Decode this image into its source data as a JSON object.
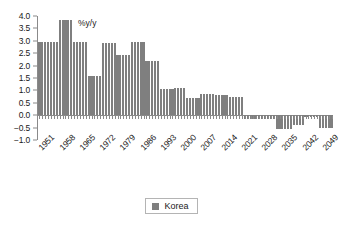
{
  "chart_data": {
    "type": "bar",
    "title": "",
    "subtitle": "",
    "annotation": "%y/y",
    "xlabel": "",
    "ylabel": "",
    "ylim": [
      -1.0,
      4.0
    ],
    "grid": false,
    "legend_position": "bottom",
    "y_ticks": [
      "4.0",
      "3.5",
      "3.0",
      "2.5",
      "2.0",
      "1.5",
      "1.0",
      "0.5",
      "0.0",
      "-0.5",
      "-1.0"
    ],
    "y_tick_values": [
      4.0,
      3.5,
      3.0,
      2.5,
      2.0,
      1.5,
      1.0,
      0.5,
      0.0,
      -0.5,
      -1.0
    ],
    "x_tick_labels": [
      "1951",
      "1958",
      "1965",
      "1972",
      "1979",
      "1986",
      "1993",
      "2000",
      "2007",
      "2014",
      "2021",
      "2028",
      "2035",
      "2042",
      "2049"
    ],
    "x_tick_step": 7,
    "series": [
      {
        "name": "Korea",
        "color": "#7f7f7f",
        "categories": [
          "1951",
          "1952",
          "1953",
          "1954",
          "1955",
          "1956",
          "1957",
          "1958",
          "1959",
          "1960",
          "1961",
          "1962",
          "1963",
          "1964",
          "1965",
          "1966",
          "1967",
          "1968",
          "1969",
          "1970",
          "1971",
          "1972",
          "1973",
          "1974",
          "1975",
          "1976",
          "1977",
          "1978",
          "1979",
          "1980",
          "1981",
          "1982",
          "1983",
          "1984",
          "1985",
          "1986",
          "1987",
          "1988",
          "1989",
          "1990",
          "1991",
          "1992",
          "1993",
          "1994",
          "1995",
          "1996",
          "1997",
          "1998",
          "1999",
          "2000",
          "2001",
          "2002",
          "2003",
          "2004",
          "2005",
          "2006",
          "2007",
          "2008",
          "2009",
          "2010",
          "2011",
          "2012",
          "2013",
          "2014",
          "2015",
          "2016",
          "2017",
          "2018",
          "2019",
          "2020",
          "2021",
          "2022",
          "2023",
          "2024",
          "2025",
          "2026",
          "2027",
          "2028",
          "2029",
          "2030",
          "2031",
          "2032",
          "2033",
          "2034",
          "2035",
          "2036",
          "2037",
          "2038",
          "2039",
          "2040",
          "2041",
          "2042",
          "2043",
          "2044",
          "2045",
          "2046",
          "2047",
          "2048",
          "2049",
          "2050",
          "2051",
          "2052"
        ],
        "values": [
          2.97,
          2.97,
          2.97,
          2.97,
          2.97,
          2.97,
          2.97,
          3.82,
          3.82,
          3.82,
          3.82,
          3.82,
          2.97,
          2.97,
          2.97,
          2.97,
          2.97,
          1.58,
          1.58,
          1.58,
          1.58,
          1.58,
          2.9,
          2.9,
          2.9,
          2.9,
          2.9,
          2.44,
          2.44,
          2.44,
          2.44,
          2.44,
          2.94,
          2.94,
          2.94,
          2.94,
          2.94,
          2.17,
          2.17,
          2.17,
          2.17,
          2.17,
          1.04,
          1.04,
          1.04,
          1.04,
          1.04,
          1.09,
          1.09,
          1.09,
          1.09,
          0.68,
          0.68,
          0.68,
          0.68,
          0.68,
          0.86,
          0.86,
          0.86,
          0.86,
          0.86,
          0.82,
          0.82,
          0.82,
          0.82,
          0.82,
          0.73,
          0.73,
          0.73,
          0.73,
          0.73,
          -0.17,
          -0.17,
          -0.17,
          -0.17,
          -0.17,
          -0.17,
          -0.17,
          -0.17,
          -0.17,
          -0.17,
          -0.17,
          -0.55,
          -0.55,
          -0.55,
          -0.55,
          -0.55,
          -0.55,
          -0.38,
          -0.38,
          -0.38,
          -0.38,
          -0.06,
          -0.06,
          -0.06,
          -0.06,
          -0.06,
          -0.5,
          -0.5,
          -0.5,
          -0.5,
          -0.5
        ]
      }
    ]
  },
  "legend": {
    "items": [
      {
        "label": "Korea",
        "color": "#7f7f7f"
      }
    ]
  }
}
